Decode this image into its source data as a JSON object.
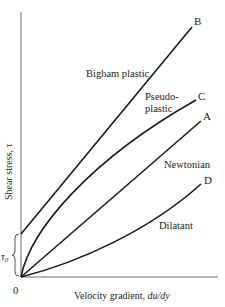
{
  "figure": {
    "y_axis_label": "Shear stress, τ",
    "x_axis_label_prefix": "Velocity gradient, ",
    "x_axis_label_var": "du/dy",
    "origin_label": "0",
    "yield_stress_label": "τ",
    "yield_stress_subscript": "0"
  },
  "curves": [
    {
      "id": "B",
      "point_label": "B",
      "name_label": "Bigham plastic"
    },
    {
      "id": "C",
      "point_label": "C",
      "name_label_line1": "Pseudo-",
      "name_label_line2": "plastic"
    },
    {
      "id": "A",
      "point_label": "A",
      "name_label": "Newtonian"
    },
    {
      "id": "D",
      "point_label": "D",
      "name_label": "Dilatant"
    }
  ],
  "colors": {
    "line": "#1a1a1a",
    "axis": "#555555",
    "background": "#ffffff"
  }
}
